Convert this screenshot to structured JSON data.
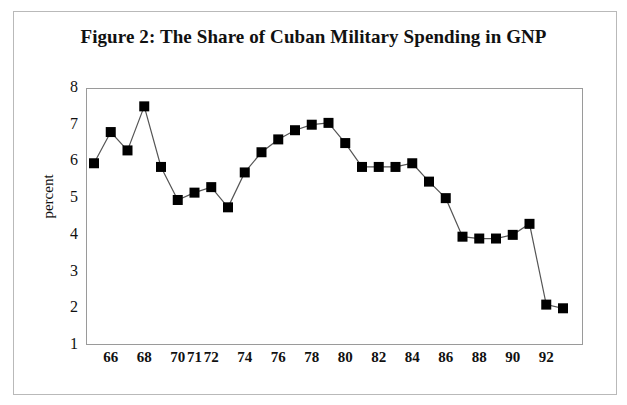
{
  "figure": {
    "title": "Figure 2: The Share of Cuban Military Spending in GNP",
    "border_color": "#b9b9b9",
    "background": "#ffffff"
  },
  "axes": {
    "y_title": "percent",
    "y_ticks": [
      "8",
      "7",
      "6",
      "5",
      "4",
      "3",
      "2",
      "1"
    ],
    "x_ticks": [
      "66",
      "68",
      "70",
      "71",
      "72",
      "74",
      "76",
      "78",
      "80",
      "82",
      "84",
      "86",
      "88",
      "90",
      "92"
    ],
    "frame_color": "#9a9a9a"
  },
  "chart_data": {
    "type": "line",
    "title": "Figure 2: The Share of Cuban Military Spending in GNP",
    "xlabel": "",
    "ylabel": "percent",
    "ylim": [
      1,
      8
    ],
    "grid": false,
    "legend": null,
    "marker": "square",
    "marker_color": "#000000",
    "line_color": "#555555",
    "x": [
      65,
      66,
      67,
      68,
      69,
      70,
      71,
      72,
      73,
      74,
      75,
      76,
      77,
      78,
      79,
      80,
      81,
      82,
      83,
      84,
      85,
      86,
      87,
      88,
      89,
      90,
      91,
      92,
      93
    ],
    "categories": [
      "65",
      "66",
      "67",
      "68",
      "69",
      "70",
      "71",
      "72",
      "73",
      "74",
      "75",
      "76",
      "77",
      "78",
      "79",
      "80",
      "81",
      "82",
      "83",
      "84",
      "85",
      "86",
      "87",
      "88",
      "89",
      "90",
      "91",
      "92",
      "93"
    ],
    "values": [
      5.95,
      6.8,
      6.3,
      7.5,
      5.85,
      4.95,
      5.15,
      5.3,
      4.75,
      5.7,
      6.25,
      6.6,
      6.85,
      7.0,
      7.05,
      6.5,
      5.85,
      5.85,
      5.85,
      5.95,
      5.45,
      5.0,
      3.95,
      3.9,
      3.9,
      4.0,
      4.3,
      2.1,
      2.0
    ],
    "x_tick_labels": [
      "66",
      "68",
      "70",
      "71",
      "72",
      "74",
      "76",
      "78",
      "80",
      "82",
      "84",
      "86",
      "88",
      "90",
      "92"
    ],
    "y_tick_labels": [
      "1",
      "2",
      "3",
      "4",
      "5",
      "6",
      "7",
      "8"
    ]
  }
}
